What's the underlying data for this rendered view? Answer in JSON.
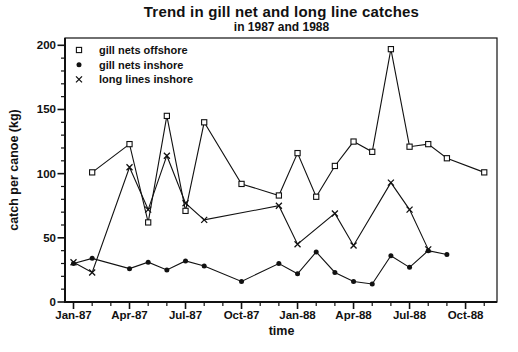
{
  "chart_data": {
    "type": "line",
    "title": "Trend in gill net and long line catches",
    "subtitle": "in 1987 and 1988",
    "xlabel": "time",
    "ylabel": "catch per canoe (kg)",
    "ylim": [
      0,
      200
    ],
    "y_ticks": [
      0,
      50,
      100,
      150,
      200
    ],
    "y_minor_tick_step": 10,
    "x_tick_labels": [
      "Jan-87",
      "Apr-87",
      "Jul-87",
      "Oct-87",
      "Jan-88",
      "Apr-88",
      "Jul-88",
      "Oct-88"
    ],
    "x_minor_tick": "monthly",
    "grid": false,
    "legend_position": "top-left-inside",
    "line_color": "#111111",
    "series": [
      {
        "name": "gill nets offshore",
        "marker": "open-square",
        "points": [
          [
            "Feb-87",
            101
          ],
          [
            "Apr-87",
            123
          ],
          [
            "May-87",
            62
          ],
          [
            "Jun-87",
            145
          ],
          [
            "Jul-87",
            71
          ],
          [
            "Aug-87",
            140
          ],
          [
            "Oct-87",
            92
          ],
          [
            "Dec-87",
            83
          ],
          [
            "Jan-88",
            116
          ],
          [
            "Feb-88",
            82
          ],
          [
            "Mar-88",
            106
          ],
          [
            "Apr-88",
            125
          ],
          [
            "May-88",
            117
          ],
          [
            "Jun-88",
            197
          ],
          [
            "Jul-88",
            121
          ],
          [
            "Aug-88",
            123
          ],
          [
            "Sep-88",
            112
          ],
          [
            "Nov-88",
            101
          ]
        ]
      },
      {
        "name": "gill nets inshore",
        "marker": "filled-circle",
        "points": [
          [
            "Jan-87",
            30
          ],
          [
            "Feb-87",
            34
          ],
          [
            "Apr-87",
            26
          ],
          [
            "May-87",
            31
          ],
          [
            "Jun-87",
            25
          ],
          [
            "Jul-87",
            32
          ],
          [
            "Aug-87",
            28
          ],
          [
            "Oct-87",
            16
          ],
          [
            "Dec-87",
            30
          ],
          [
            "Jan-88",
            22
          ],
          [
            "Feb-88",
            39
          ],
          [
            "Mar-88",
            23
          ],
          [
            "Apr-88",
            16
          ],
          [
            "May-88",
            14
          ],
          [
            "Jun-88",
            36
          ],
          [
            "Jul-88",
            27
          ],
          [
            "Aug-88",
            40
          ],
          [
            "Sep-88",
            37
          ]
        ]
      },
      {
        "name": "long lines inshore",
        "marker": "x-cross",
        "points": [
          [
            "Jan-87",
            31
          ],
          [
            "Feb-87",
            23
          ],
          [
            "Apr-87",
            105
          ],
          [
            "May-87",
            72
          ],
          [
            "Jun-87",
            114
          ],
          [
            "Jul-87",
            77
          ],
          [
            "Aug-87",
            64
          ],
          [
            "Dec-87",
            75
          ],
          [
            "Jan-88",
            45
          ],
          [
            "Mar-88",
            69
          ],
          [
            "Apr-88",
            44
          ],
          [
            "Jun-88",
            93
          ],
          [
            "Jul-88",
            72
          ],
          [
            "Aug-88",
            41
          ]
        ]
      }
    ]
  }
}
